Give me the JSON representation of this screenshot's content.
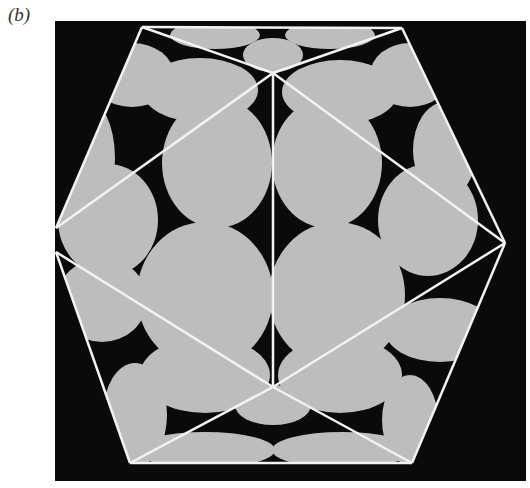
{
  "figure": {
    "panel_label": "(b)",
    "colors": {
      "background": "#0a0a0a",
      "blob": "#bdbdbd",
      "blob_light": "#cfcfcf",
      "edge": "#f2f2f2",
      "page": "#ffffff"
    },
    "panel_rect": {
      "x": 55,
      "y": 21,
      "w": 471,
      "h": 460
    },
    "hull": [
      [
        142,
        27
      ],
      [
        402,
        28
      ],
      [
        505,
        243
      ],
      [
        412,
        463
      ],
      [
        130,
        463
      ],
      [
        56,
        252
      ],
      [
        56,
        228
      ]
    ],
    "vertices": {
      "top": [
        273,
        73
      ],
      "bottom": [
        273,
        387
      ],
      "right": [
        505,
        243
      ],
      "left_upper": [
        56,
        228
      ],
      "left_lower": [
        56,
        252
      ],
      "top_left": [
        142,
        27
      ],
      "top_right": [
        402,
        28
      ],
      "bottom_left": [
        130,
        463
      ],
      "bottom_right": [
        412,
        463
      ]
    },
    "edges": [
      [
        "top",
        "bottom"
      ],
      [
        "top",
        "right"
      ],
      [
        "top",
        "left_upper"
      ],
      [
        "bottom",
        "right"
      ],
      [
        "bottom",
        "left_lower"
      ],
      [
        "top_left",
        "top_right"
      ],
      [
        "top_right",
        "right"
      ],
      [
        "right",
        "bottom_right"
      ],
      [
        "bottom_right",
        "bottom_left"
      ],
      [
        "bottom_left",
        "left_lower"
      ],
      [
        "left_upper",
        "top_left"
      ],
      [
        "top_left",
        "top"
      ],
      [
        "top_right",
        "top"
      ],
      [
        "bottom_left",
        "bottom"
      ],
      [
        "bottom_right",
        "bottom"
      ]
    ],
    "blobs": [
      {
        "cx": 217,
        "cy": 163,
        "rx": 55,
        "ry": 65
      },
      {
        "cx": 327,
        "cy": 163,
        "rx": 55,
        "ry": 65
      },
      {
        "cx": 205,
        "cy": 295,
        "rx": 68,
        "ry": 73
      },
      {
        "cx": 337,
        "cy": 295,
        "rx": 68,
        "ry": 73
      },
      {
        "cx": 108,
        "cy": 220,
        "rx": 50,
        "ry": 56
      },
      {
        "cx": 428,
        "cy": 220,
        "rx": 50,
        "ry": 56
      },
      {
        "cx": 200,
        "cy": 90,
        "rx": 58,
        "ry": 32
      },
      {
        "cx": 340,
        "cy": 92,
        "rx": 58,
        "ry": 32
      },
      {
        "cx": 132,
        "cy": 75,
        "rx": 42,
        "ry": 32
      },
      {
        "cx": 410,
        "cy": 75,
        "rx": 40,
        "ry": 32
      },
      {
        "cx": 85,
        "cy": 158,
        "rx": 30,
        "ry": 60
      },
      {
        "cx": 445,
        "cy": 150,
        "rx": 32,
        "ry": 48
      },
      {
        "cx": 273,
        "cy": 55,
        "rx": 30,
        "ry": 17
      },
      {
        "cx": 215,
        "cy": 35,
        "rx": 45,
        "ry": 14
      },
      {
        "cx": 330,
        "cy": 35,
        "rx": 45,
        "ry": 14
      },
      {
        "cx": 102,
        "cy": 300,
        "rx": 45,
        "ry": 42
      },
      {
        "cx": 440,
        "cy": 330,
        "rx": 55,
        "ry": 32
      },
      {
        "cx": 205,
        "cy": 375,
        "rx": 65,
        "ry": 38
      },
      {
        "cx": 340,
        "cy": 375,
        "rx": 62,
        "ry": 38
      },
      {
        "cx": 135,
        "cy": 415,
        "rx": 32,
        "ry": 52
      },
      {
        "cx": 410,
        "cy": 420,
        "rx": 28,
        "ry": 45
      },
      {
        "cx": 273,
        "cy": 405,
        "rx": 38,
        "ry": 20
      },
      {
        "cx": 205,
        "cy": 450,
        "rx": 70,
        "ry": 18
      },
      {
        "cx": 342,
        "cy": 450,
        "rx": 70,
        "ry": 18
      }
    ]
  }
}
